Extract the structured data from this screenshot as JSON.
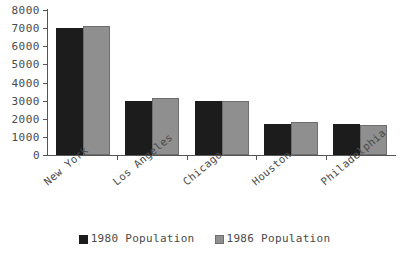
{
  "chart_data": {
    "type": "bar",
    "title": "",
    "subtitle": "",
    "xlabel": "",
    "ylabel": "",
    "ylim": [
      0,
      8000
    ],
    "ytick_labels": [
      "0",
      "1000",
      "2000",
      "3000",
      "4000",
      "5000",
      "6000",
      "7000",
      "8000"
    ],
    "ytick_values": [
      0,
      1000,
      2000,
      3000,
      4000,
      5000,
      6000,
      7000,
      8000
    ],
    "grid": false,
    "legend_position": "bottom-center",
    "categories": [
      "New York",
      "Los Angeles",
      "Chicago",
      "Houston",
      "Philadelphia"
    ],
    "series": [
      {
        "name": "1980 Population",
        "color": "#1c1c1c",
        "values": [
          7000,
          3000,
          3000,
          1700,
          1700
        ]
      },
      {
        "name": "1986 Population",
        "color": "#8f8f8f",
        "values": [
          7100,
          3150,
          2980,
          1800,
          1680
        ]
      }
    ]
  },
  "axis": {
    "line_color": "#555555"
  },
  "legend": {
    "items": [
      {
        "label": "1980 Population",
        "swatch": "dark-swatch"
      },
      {
        "label": "1986 Population",
        "swatch": "light-swatch"
      }
    ]
  }
}
